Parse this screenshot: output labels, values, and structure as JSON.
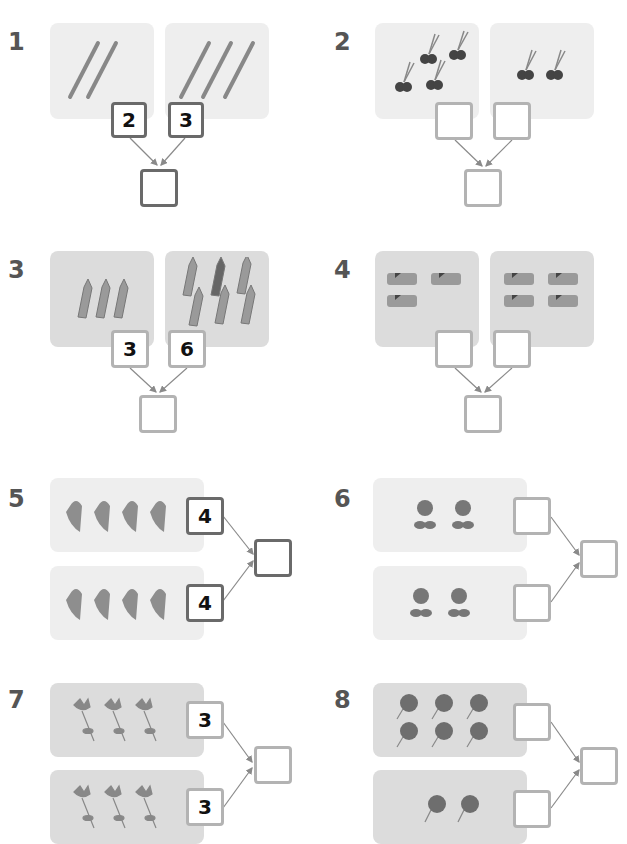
{
  "exercises": [
    {
      "number": "1",
      "layout": "vertical",
      "objects": "pencils",
      "groups": [
        {
          "count": 2,
          "box_value": "2"
        },
        {
          "count": 3,
          "box_value": "3"
        }
      ],
      "total_value": ""
    },
    {
      "number": "2",
      "layout": "vertical",
      "objects": "scissors",
      "groups": [
        {
          "count": 4,
          "box_value": ""
        },
        {
          "count": 2,
          "box_value": ""
        }
      ],
      "total_value": ""
    },
    {
      "number": "3",
      "layout": "vertical",
      "objects": "crayons",
      "groups": [
        {
          "count": 3,
          "box_value": "3"
        },
        {
          "count": 6,
          "box_value": "6"
        }
      ],
      "total_value": ""
    },
    {
      "number": "4",
      "layout": "vertical",
      "objects": "erasers",
      "groups": [
        {
          "count": 3,
          "box_value": ""
        },
        {
          "count": 4,
          "box_value": ""
        }
      ],
      "total_value": ""
    },
    {
      "number": "5",
      "layout": "horizontal",
      "objects": "tulips",
      "groups": [
        {
          "count": 4,
          "box_value": "4"
        },
        {
          "count": 4,
          "box_value": "4"
        }
      ],
      "total_value": ""
    },
    {
      "number": "6",
      "layout": "horizontal",
      "objects": "flowers",
      "groups": [
        {
          "count": 2,
          "box_value": ""
        },
        {
          "count": 2,
          "box_value": ""
        }
      ],
      "total_value": ""
    },
    {
      "number": "7",
      "layout": "horizontal",
      "objects": "daisies",
      "groups": [
        {
          "count": 3,
          "box_value": "3"
        },
        {
          "count": 3,
          "box_value": "3"
        }
      ],
      "total_value": ""
    },
    {
      "number": "8",
      "layout": "horizontal",
      "objects": "roses",
      "groups": [
        {
          "count": 6,
          "box_value": ""
        },
        {
          "count": 2,
          "box_value": ""
        }
      ],
      "total_value": ""
    }
  ],
  "colors": {
    "number": "#555555",
    "panel_light": "#eeeeee",
    "panel_dark": "#dcdcdc",
    "box_border": "#8a8a8a",
    "line": "#999999"
  }
}
